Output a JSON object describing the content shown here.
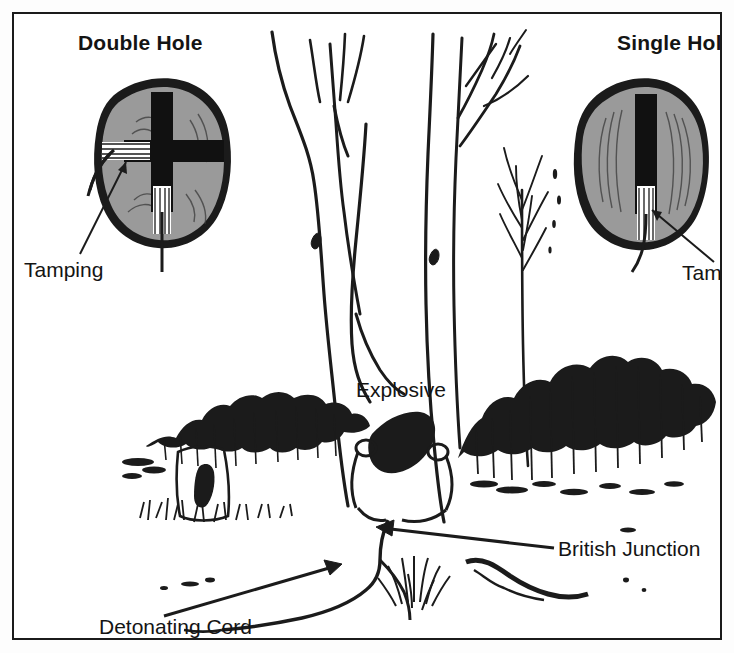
{
  "figure": {
    "frame_color": "#1b1b1b",
    "background_color": "#ffffff",
    "wood_fill_color": "#9a9a9a",
    "bark_outline_color": "#1b1b1b",
    "borehole_color": "#111111",
    "ink_color": "#141414"
  },
  "headings": {
    "left": "Double Hole",
    "right": "Single Hole"
  },
  "callouts": {
    "tamping_left": "Tamping",
    "tamping_right": "Tampi",
    "explosive": "Explosive",
    "british_junction": "British Junction",
    "detonating_cord": "Detonating Cord"
  },
  "cross_sections": [
    {
      "name": "double-hole",
      "heading": "Double Hole",
      "hole_count": 2,
      "hole_orientation": [
        "vertical",
        "horizontal"
      ],
      "callout": "Tamping"
    },
    {
      "name": "single-hole",
      "heading": "Single Hole",
      "hole_count": 1,
      "hole_orientation": [
        "vertical"
      ],
      "callout": "Tampi"
    }
  ],
  "scene": {
    "elements": [
      "tree-trunk-forked",
      "tree-trunk-secondary",
      "sapling",
      "shrub-line",
      "tree-stump",
      "grass-tuft",
      "ground-line",
      "explosive-charge",
      "detonating-cord",
      "british-junction"
    ]
  }
}
